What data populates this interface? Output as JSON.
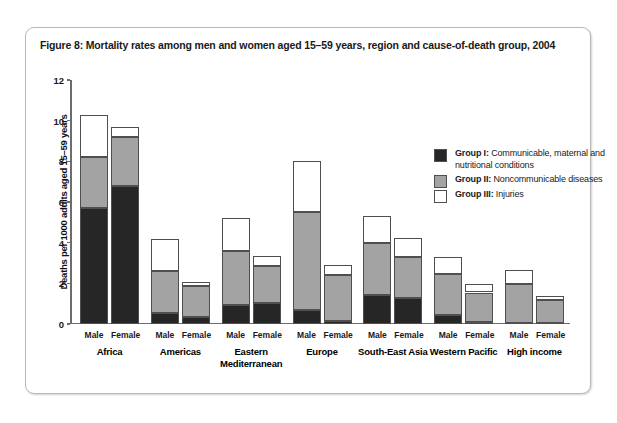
{
  "figure": {
    "title": "Figure 8: Mortality rates among men and women aged 15–59 years, region and cause-of-death group, 2004"
  },
  "legend": {
    "position": "inside-top-right",
    "items": [
      {
        "name": "Group I:",
        "desc": "Communicable, maternal and nutritional conditions",
        "color": "#262626"
      },
      {
        "name": "Group II:",
        "desc": "Noncommunicable diseases",
        "color": "#a3a3a3"
      },
      {
        "name": "Group III:",
        "desc": "Injuries",
        "color": "#ffffff"
      }
    ]
  },
  "axes": {
    "ylabel": "Deaths per 1000 adults aged 15–59 years",
    "xlabel": "",
    "yticks": [
      0,
      2,
      4,
      6,
      8,
      10,
      12
    ],
    "ylim": [
      0,
      12
    ]
  },
  "chart_data": {
    "type": "bar",
    "stacked": true,
    "title": "Figure 8: Mortality rates among men and women aged 15–59 years, region and cause-of-death group, 2004",
    "xlabel": "",
    "ylabel": "Deaths per 1000 adults aged 15–59 years",
    "ylim": [
      0,
      12
    ],
    "yticks": [
      0,
      2,
      4,
      6,
      8,
      10,
      12
    ],
    "grid": false,
    "legend_position": "inside-top-right",
    "series": [
      {
        "name": "Group I: Communicable, maternal and nutritional conditions",
        "color": "#262626"
      },
      {
        "name": "Group II: Noncommunicable diseases",
        "color": "#a3a3a3"
      },
      {
        "name": "Group III: Injuries",
        "color": "#ffffff"
      }
    ],
    "regions": [
      {
        "label": "Africa",
        "bars": [
          {
            "sex": "Male",
            "group1": 5.7,
            "group2": 2.5,
            "group3": 2.1,
            "total": 10.3
          },
          {
            "sex": "Female",
            "group1": 6.8,
            "group2": 2.4,
            "group3": 0.5,
            "total": 9.7
          }
        ]
      },
      {
        "label": "Americas",
        "bars": [
          {
            "sex": "Male",
            "group1": 0.55,
            "group2": 2.05,
            "group3": 1.6,
            "total": 4.2
          },
          {
            "sex": "Female",
            "group1": 0.35,
            "group2": 1.5,
            "group3": 0.2,
            "total": 2.05
          }
        ]
      },
      {
        "label": "Eastern Mediterranean",
        "bars": [
          {
            "sex": "Male",
            "group1": 0.95,
            "group2": 2.65,
            "group3": 1.6,
            "total": 5.2
          },
          {
            "sex": "Female",
            "group1": 1.05,
            "group2": 1.8,
            "group3": 0.5,
            "total": 3.35
          }
        ]
      },
      {
        "label": "Europe",
        "bars": [
          {
            "sex": "Male",
            "group1": 0.7,
            "group2": 4.8,
            "group3": 2.5,
            "total": 8.0
          },
          {
            "sex": "Female",
            "group1": 0.15,
            "group2": 2.25,
            "group3": 0.5,
            "total": 2.9
          }
        ]
      },
      {
        "label": "South-East Asia",
        "bars": [
          {
            "sex": "Male",
            "group1": 1.45,
            "group2": 2.55,
            "group3": 1.3,
            "total": 5.3
          },
          {
            "sex": "Female",
            "group1": 1.3,
            "group2": 2.0,
            "group3": 0.95,
            "total": 4.25
          }
        ]
      },
      {
        "label": "Western Pacific",
        "bars": [
          {
            "sex": "Male",
            "group1": 0.45,
            "group2": 2.0,
            "group3": 0.85,
            "total": 3.3
          },
          {
            "sex": "Female",
            "group1": 0.1,
            "group2": 1.45,
            "group3": 0.4,
            "total": 1.95
          }
        ]
      },
      {
        "label": "High income",
        "bars": [
          {
            "sex": "Male",
            "group1": 0.05,
            "group2": 1.9,
            "group3": 0.7,
            "total": 2.65
          },
          {
            "sex": "Female",
            "group1": 0.05,
            "group2": 1.15,
            "group3": 0.2,
            "total": 1.4
          }
        ]
      }
    ]
  }
}
